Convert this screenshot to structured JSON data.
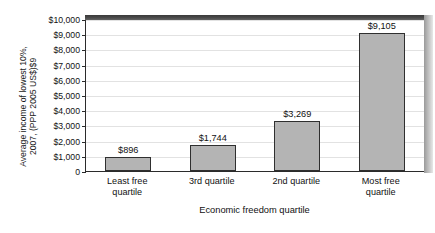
{
  "chart_data": {
    "type": "bar",
    "title": "",
    "subtitle": "",
    "xlabel": "Economic freedom quartile",
    "ylabel": "Average income of lowest 10%,\n2007, (PPP 2005 US$)$9",
    "categories": [
      "Least free\nquartile",
      "3rd quartile",
      "2nd quartile",
      "Most free\nquartile"
    ],
    "values": [
      896,
      3269,
      1744,
      9105
    ],
    "series": [
      {
        "name": "Average income of lowest 10%",
        "values": [
          896,
          1744,
          3269,
          9105
        ]
      }
    ],
    "bars": [
      {
        "category": "Least free\nquartile",
        "value": 896,
        "label": "$896"
      },
      {
        "category": "3rd quartile",
        "value": 1744,
        "label": "$1,744"
      },
      {
        "category": "2nd quartile",
        "value": 3269,
        "label": "$3,269"
      },
      {
        "category": "Most free\nquartile",
        "value": 9105,
        "label": "$9,105"
      }
    ],
    "ylim": [
      0,
      10000
    ],
    "ytick_step": 1000,
    "ytick_labels": [
      "$10,000",
      "$9,000",
      "$8,000",
      "$7,000",
      "$6,000",
      "$5,000",
      "$4,000",
      "$3,000",
      "$2,000",
      "$1,000",
      "0"
    ],
    "ytick_values": [
      10000,
      9000,
      8000,
      7000,
      6000,
      5000,
      4000,
      3000,
      2000,
      1000,
      0
    ],
    "grid": true,
    "legend": false,
    "legend_position": "none",
    "colors": {
      "bar_fill": "#b4b4b4",
      "bar_edge": "#2f2f2f",
      "gridline": "#e2e2e2",
      "axis": "#2b2b2b",
      "plot_background": "#ffffff",
      "shadow_top": "#3f3f3f",
      "shadow_right": "#bdbdbd",
      "text": "#111111"
    }
  }
}
